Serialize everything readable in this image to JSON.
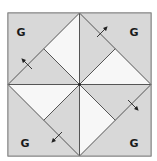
{
  "diagram": {
    "type": "quilt-block",
    "colors": {
      "background": "#ffffff",
      "gray_fabric": "#d8d8d8",
      "white_fabric": "#f7f7f7",
      "seam_line": "#555555",
      "arrow": "#222222"
    },
    "corner_labels": [
      {
        "position": "top-left",
        "text": "G"
      },
      {
        "position": "top-right",
        "text": "G"
      },
      {
        "position": "bottom-left",
        "text": "G"
      },
      {
        "position": "bottom-right",
        "text": "G"
      }
    ],
    "pressing_arrows": [
      {
        "position": "top-left-edge",
        "direction": "up-left"
      },
      {
        "position": "top-right-edge",
        "direction": "up-right"
      },
      {
        "position": "bottom-right-edge",
        "direction": "down-right"
      },
      {
        "position": "bottom-left-edge",
        "direction": "down-left"
      }
    ]
  }
}
